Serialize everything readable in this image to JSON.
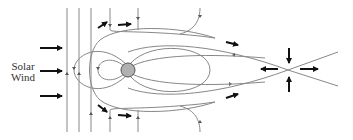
{
  "diagram": {
    "labels": {
      "solar": "Solar",
      "wind": "Wind"
    },
    "colors": {
      "field_line": "#888888",
      "arrow": "#111111",
      "earth_fill": "#b0b0b0",
      "earth_stroke": "#555555",
      "text": "#333333"
    },
    "elements": {
      "earth": "planet",
      "solar_wind_arrows": 3,
      "imf_lines_vertical": 3,
      "reconnection_x_point": "tail-neutral-point"
    }
  }
}
